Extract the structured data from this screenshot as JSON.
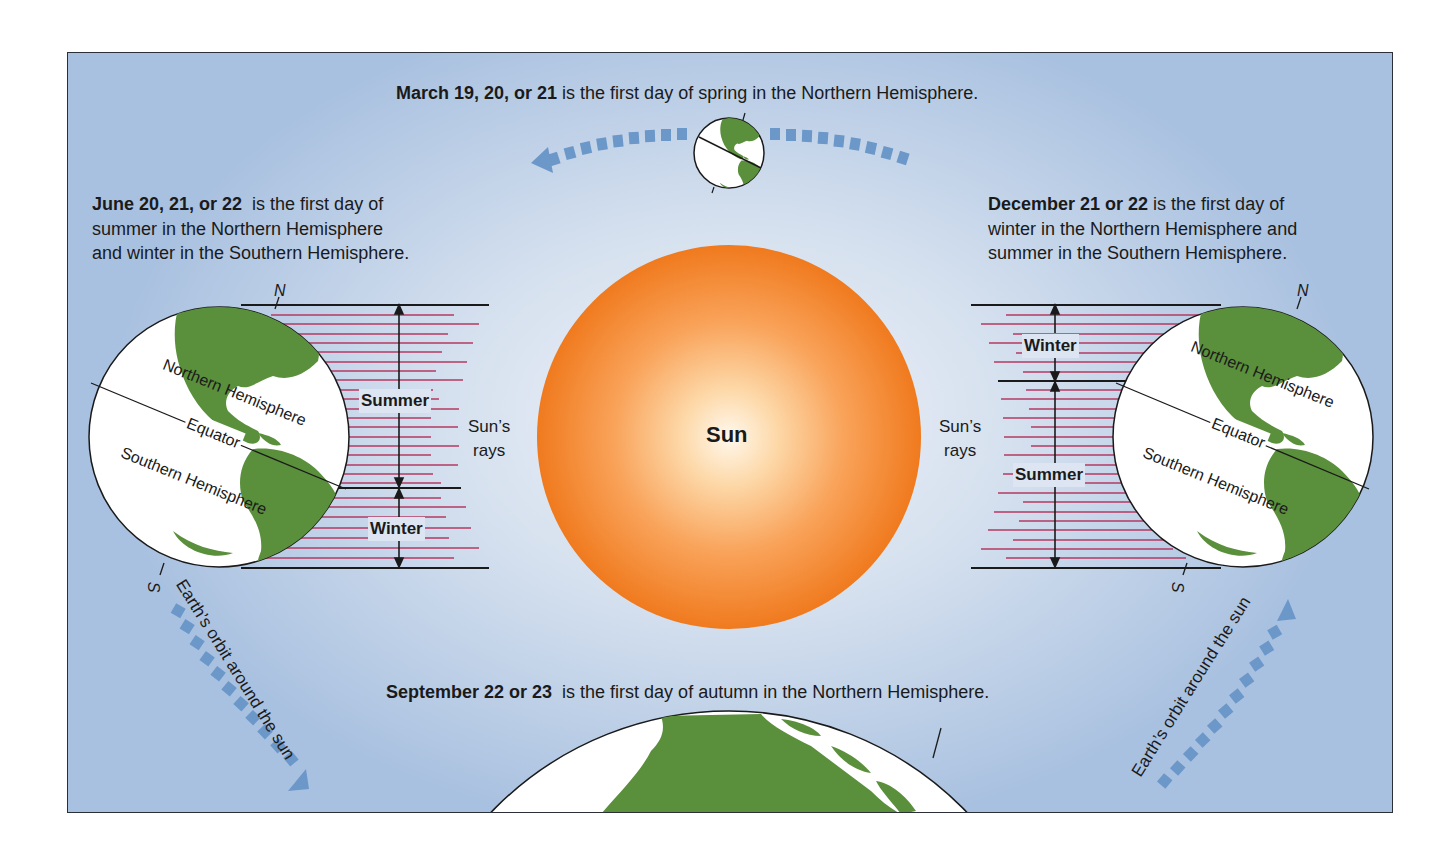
{
  "colors": {
    "background_outer": "#a9c1e0",
    "background_center": "#eef2f8",
    "sun_edge": "#f07a1e",
    "sun_center": "#fff6e6",
    "land": "#5a8f3c",
    "ray": "#b53a62",
    "orbit_arrow": "#6c97c9",
    "line": "#1a1a1a"
  },
  "captions": {
    "march": {
      "bold": "March 19, 20, or 21",
      "rest": " is the first day of spring in the Northern Hemisphere."
    },
    "june": {
      "bold": "June 20, 21, or 22",
      "line1_rest": "  is the first day of",
      "line2": "summer in the Northern Hemisphere",
      "line3": "and winter in the Southern Hemisphere."
    },
    "december": {
      "bold": "December 21 or 22",
      "line1_rest": " is the first day of",
      "line2": "winter in the Northern Hemisphere and",
      "line3": "summer in the Southern Hemisphere."
    },
    "september": {
      "bold": "September 22 or 23",
      "rest": "  is the first day of autumn in the Northern Hemisphere."
    }
  },
  "sun": {
    "label": "Sun"
  },
  "left_earth": {
    "north": "N",
    "south": "S",
    "northern_hemisphere": "Northern Hemisphere",
    "equator": "Equator",
    "southern_hemisphere": "Southern Hemisphere",
    "zone_top": "Summer",
    "zone_bottom": "Winter",
    "rays_line1": "Sun’s",
    "rays_line2": "rays"
  },
  "right_earth": {
    "north": "N",
    "south": "S",
    "northern_hemisphere": "Northern Hemisphere",
    "equator": "Equator",
    "southern_hemisphere": "Southern Hemisphere",
    "zone_top": "Winter",
    "zone_bottom": "Summer",
    "rays_line1": "Sun’s",
    "rays_line2": "rays"
  },
  "orbit": {
    "left_label": "Earth’s orbit around the sun",
    "right_label": "Earth’s orbit around the sun"
  }
}
